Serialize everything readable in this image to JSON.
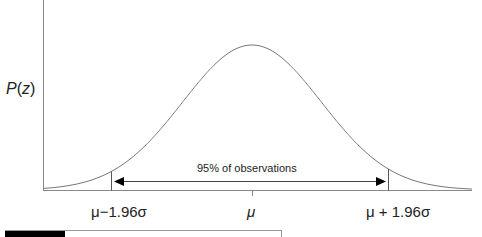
{
  "chart_data": {
    "type": "line",
    "title": "",
    "xlabel": "",
    "ylabel": "P(z)",
    "x_ticks": [
      "μ−1.96σ",
      "μ",
      "μ + 1.96σ"
    ],
    "x_tick_values_sigma": [
      -1.96,
      0,
      1.96
    ],
    "x_range_sigma": [
      -3.6,
      3.6
    ],
    "series": [
      {
        "name": "P(z)",
        "distribution": "normal",
        "mean": 0,
        "sd": 1
      }
    ],
    "annotations": [
      {
        "text": "95% of observations",
        "type": "double-arrow",
        "from": -1.96,
        "to": 1.96
      }
    ],
    "grid": false,
    "legend": "none"
  },
  "labels": {
    "ylabel_italic": "P",
    "ylabel_paren_open": "(",
    "ylabel_var": "z",
    "ylabel_paren_close": ")",
    "tick_left": "μ−1.96σ",
    "tick_mid": "μ",
    "tick_right": "μ + 1.96σ",
    "annotation": "95% of observations"
  },
  "colors": {
    "axis": "#777777",
    "curve": "#777777",
    "arrow": "#000000",
    "bar_fill": "#000000"
  }
}
